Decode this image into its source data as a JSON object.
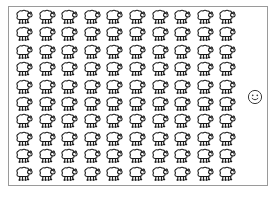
{
  "canvas": {
    "width": 279,
    "height": 201,
    "background_color": "#ffffff"
  },
  "frame": {
    "name": "content-frame",
    "border_color": "#9a9a9a",
    "fill_color": "#ffffff",
    "x": 8,
    "y": 6,
    "width": 260,
    "height": 180
  },
  "sheep_grid": {
    "icon_name": "sheep-icon",
    "rows": 10,
    "columns": 10,
    "total_count": 100,
    "column_spacing": 22.6,
    "row_spacing": 17.4,
    "origin_x": 13,
    "origin_y": 9,
    "icon_width": 21,
    "icon_height": 16,
    "outline_color": "#1a1a1a",
    "fill_color": "#ffffff",
    "head_direction": "right"
  },
  "smiley": {
    "icon_name": "smiley-face-icon",
    "x": 247,
    "y": 89,
    "size": 16,
    "outline_color": "#3a3a3a",
    "fill_color": "#ffffff",
    "expression": "smile"
  }
}
